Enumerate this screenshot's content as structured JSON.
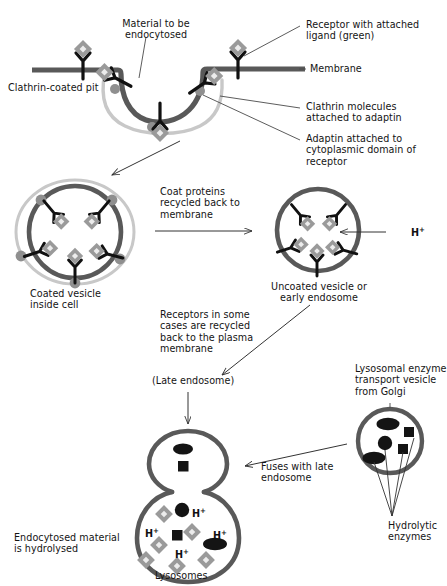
{
  "diagram": {
    "colors": {
      "membrane_dark": "#595959",
      "clathrin_coat_light": "#c8c8c8",
      "adaptin_dot": "#8f8f8f",
      "receptor_black": "#111111",
      "ligand_diamond": "#9a9a9a",
      "ligand_diamond_center": "#e6e6e6",
      "enzyme_dark": "#141414",
      "text": "#141414",
      "leader_line": "#4a4a4a"
    }
  },
  "labels": {
    "clathrin_coated_pit": "Clathrin-coated pit",
    "material_to_be_endocytosed": "Material to be\nendocytosed",
    "receptor_with_ligand": "Receptor with attached\nligand (green)",
    "membrane": "Membrane",
    "clathrin_molecules": "Clathrin molecules\nattached to adaptin",
    "adaptin_attached": "Adaptin attached to\ncytoplasmic domain of\nreceptor",
    "coated_vesicle": "Coated vesicle\ninside cell",
    "coat_proteins_recycled": "Coat proteins\nrecycled back to\nmembrane",
    "uncoated_vesicle": "Uncoated vesicle or\nearly endosome",
    "proton": "H",
    "proton_charge": "+",
    "receptors_recycled": "Receptors in some\ncases are recycled\nback to the plasma\nmembrane",
    "late_endosome": "(Late endosome)",
    "lysosomal_enzyme_vesicle": "Lysosomal enzyme\ntransport vesicle\nfrom Golgi",
    "fuses_with_late_endosome": "Fuses with late\nendosome",
    "hydrolytic_enzymes": "Hydrolytic\nenzymes",
    "endocytosed_material": "Endocytosed material\nis hydrolysed",
    "lysosomes": "Lysosomes"
  },
  "stages": [
    {
      "id": "clathrin-coated-pit",
      "name": "Clathrin-coated pit",
      "receptor_count": 5,
      "adaptin_count": 3,
      "has_clathrin_coat": true
    },
    {
      "id": "coated-vesicle",
      "name": "Coated vesicle inside cell",
      "receptor_count": 5,
      "adaptin_count": 5,
      "has_clathrin_coat": true
    },
    {
      "id": "uncoated-vesicle",
      "name": "Uncoated vesicle or early endosome",
      "receptor_count": 5,
      "adaptin_count": 0,
      "has_clathrin_coat": false,
      "proton_influx": true
    },
    {
      "id": "late-endosome-lysosome",
      "name": "Lysosomes",
      "proton_labels": 4,
      "ligand_diamonds": 6,
      "enzyme_ellipses": 2,
      "enzyme_circles": 1,
      "enzyme_squares": 1
    },
    {
      "id": "golgi-transport-vesicle",
      "name": "Lysosomal enzyme transport vesicle from Golgi",
      "enzyme_ellipses": 2,
      "enzyme_circles": 1,
      "enzyme_squares": 2,
      "pointer_lines": 4
    }
  ]
}
